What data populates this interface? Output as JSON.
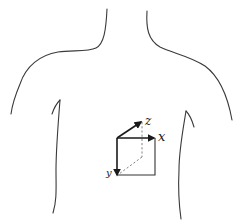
{
  "figure": {
    "colors": {
      "background": "#ffffff",
      "outline": "#3a3a3a",
      "axes": "#1a1a1a",
      "dashed": "#777777"
    }
  },
  "axes": {
    "x": {
      "label": "x"
    },
    "y": {
      "label": "y"
    },
    "z": {
      "label": "z"
    }
  }
}
